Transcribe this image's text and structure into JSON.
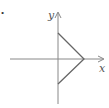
{
  "diagram": {
    "bullet": "•",
    "axes": {
      "x_label": "x",
      "y_label": "y",
      "color": "#777777"
    },
    "shape": {
      "type": "open-triangle",
      "color": "#555555",
      "vertices": [
        [
          0,
          1
        ],
        [
          1,
          0
        ],
        [
          0,
          -1
        ]
      ]
    }
  }
}
